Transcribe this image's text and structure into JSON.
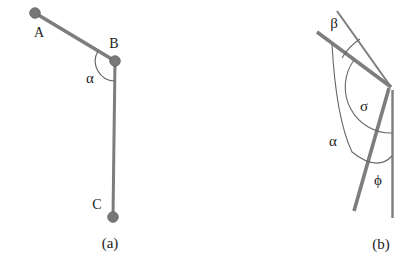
{
  "figure": {
    "type": "physics-rod-angle-diagram",
    "colors": {
      "rod_gray": "#7d7d7d",
      "joint_gray": "#767676",
      "arc_gray": "#666666",
      "text": "#222222"
    },
    "panel_a": {
      "caption": "(a)",
      "labels": {
        "point_a": "A",
        "point_b": "B",
        "point_c": "C",
        "angle_alpha": "α"
      }
    },
    "panel_b": {
      "caption": "(b)",
      "labels": {
        "angle_beta": "β",
        "angle_sigma": "σ",
        "angle_alpha": "α",
        "angle_phi": "ϕ"
      }
    }
  }
}
